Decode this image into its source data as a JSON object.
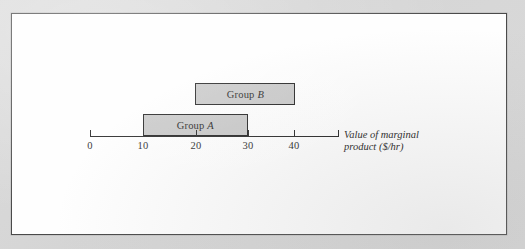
{
  "figure": {
    "frame": {
      "border_color": "#4a4a4a",
      "background": "#fefefe"
    },
    "page_background": "#d9d9d9"
  },
  "chart_data": {
    "type": "bar",
    "orientation": "horizontal",
    "title": "",
    "xlabel_line1": "Value of marginal",
    "xlabel_line2": "product ($/hr)",
    "ylabel": "",
    "xlim": [
      0,
      47
    ],
    "axis_ticks": [
      0,
      10,
      20,
      30,
      40
    ],
    "tick_labels": [
      "0",
      "10",
      "20",
      "30",
      "40"
    ],
    "grid": false,
    "legend": "none",
    "box_fill_color": "#c6c6c6",
    "box_border_color": "#151515",
    "series": [
      {
        "name": "Group A",
        "label_prefix": "Group ",
        "label_italic": "A",
        "start": 10,
        "end": 30,
        "row": 0
      },
      {
        "name": "Group B",
        "label_prefix": "Group ",
        "label_italic": "B",
        "start": 20,
        "end": 39,
        "row": 1
      }
    ]
  }
}
